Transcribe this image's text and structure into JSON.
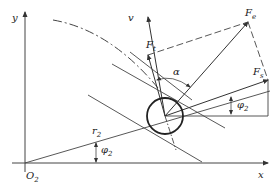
{
  "diagram": {
    "type": "force-vector-geometry",
    "labels": {
      "y_axis": "y",
      "x_axis": "x",
      "origin": {
        "main": "O",
        "sub": "2"
      },
      "radius": {
        "main": "r",
        "sub": "2"
      },
      "angle_phi_lower": {
        "main": "φ",
        "sub": "2"
      },
      "angle_phi_upper": {
        "main": "φ",
        "sub": "2"
      },
      "alpha": "α",
      "velocity": "v",
      "force_e": {
        "main": "F",
        "sub": "e"
      },
      "force_t": {
        "main": "F",
        "sub": "t"
      },
      "force_s": {
        "main": "F",
        "sub": "s"
      }
    },
    "colors": {
      "stroke": "#333333",
      "background": "#ffffff"
    }
  }
}
